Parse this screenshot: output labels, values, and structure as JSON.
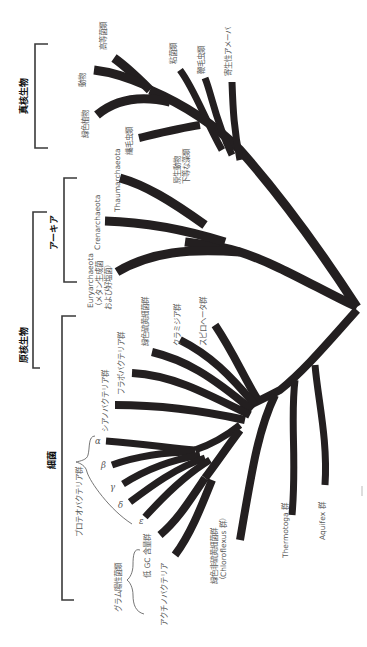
{
  "groups": {
    "eukaryota": "真核生物",
    "archaea": "アーキア",
    "prokaryota": "原核生物",
    "bacteria": "細菌"
  },
  "eukaryota_taxa": {
    "higher_fungi": "高等菌類",
    "animals": "動物",
    "green_plants": "緑色植物",
    "ciliates": "繊毛虫類",
    "slime_molds": "粘菌類",
    "flagellates": "鞭毛虫類",
    "parasitic_amoebae": "寄生性アメーバ",
    "protozoa_line1": "原生動物",
    "protozoa_line2": "下等な藻類"
  },
  "archaea_taxa": {
    "thaumarchaeota": "Thaumarchaeota",
    "crenarchaeota": "Crenarchaeota",
    "euryarchaeota_line1": "Euryarchaeota",
    "euryarchaeota_line2": "（メタン生成菌",
    "euryarchaeota_line3": "および好塩菌）"
  },
  "bacteria_taxa": {
    "spirochetes": "スピロヘータ群",
    "chlamydiae": "クラミジア群",
    "green_sulfur": "緑色硫黄細菌群",
    "flavobacteria": "フラボバクテリア群",
    "cyanobacteria": "シアノバクテリア群",
    "proteobacteria": "プロテオバクテリア群",
    "alpha": "α",
    "beta": "β",
    "gamma": "γ",
    "delta": "δ",
    "epsilon": "ε",
    "gram_positive": "グラム陽性菌類",
    "low_gc": "低 GC 含量群",
    "actinobacteria": "アクチノバクテリア",
    "green_nonsulfur_line1": "緑色非硫黄細菌群",
    "green_nonsulfur_line2": "（Chloroflexus 群）",
    "thermotoga": "Thermotoga 群",
    "aquifex": "Aquifex 群"
  },
  "colors": {
    "branch": "#231f20",
    "label": "#5a5a5a",
    "group_label": "#111111"
  }
}
